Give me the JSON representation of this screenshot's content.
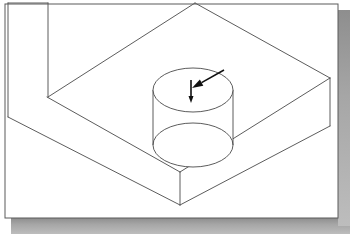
{
  "document": {
    "title": "Isometric Solid Model with Cylindrical Boss",
    "drawing_type": "isometric-line-drawing",
    "background_color": "#ffffff",
    "line_color": "#4a4a4a",
    "annotation_color": "#101010",
    "frame_color": "#5a5a5a",
    "shadow_color": "#9a9a9a"
  },
  "canvas": {
    "width": 350,
    "height": 234
  },
  "frame": {
    "name": "drawing-border",
    "x": 5,
    "y": 4,
    "width": 333,
    "height": 214,
    "shadow_offset": 6
  },
  "geometry": {
    "description": "Rectangular isometric base block with a notched upper-left step and a cylindrical boss rising from the top face.",
    "top_face": {
      "name": "block-top-face",
      "points": "8,3 48,3 48,97 195,3 330,78 180,172 47,97"
    },
    "left_face": {
      "name": "block-left-front-face",
      "points": "8,3 8,117 180,205 180,172 47,97 47,3"
    },
    "right_face": {
      "name": "block-right-front-face",
      "points": "180,172 330,78 330,126 180,205"
    },
    "edges": [
      {
        "name": "edge-top-back-left",
        "d": "M 8,3 L 48,3"
      },
      {
        "name": "edge-vertical-notch",
        "d": "M 48,3 L 48,97"
      },
      {
        "name": "edge-top-left-diagonal",
        "d": "M 48,97 L 195,3"
      },
      {
        "name": "edge-top-right-diagonal",
        "d": "M 195,3 L 330,78"
      },
      {
        "name": "edge-top-front-right",
        "d": "M 330,78 L 180,172"
      },
      {
        "name": "edge-top-front-left",
        "d": "M 180,172 L 47,97"
      },
      {
        "name": "edge-left-outer-vertical",
        "d": "M 8,3 L 8,117"
      },
      {
        "name": "edge-left-bottom-diagonal",
        "d": "M 8,117 L 180,205"
      },
      {
        "name": "edge-front-vertical",
        "d": "M 180,172 L 180,205"
      },
      {
        "name": "edge-right-vertical",
        "d": "M 330,78 L 330,126"
      },
      {
        "name": "edge-right-bottom-diagonal",
        "d": "M 330,126 L 180,205"
      }
    ]
  },
  "cylinder": {
    "name": "cylindrical-boss",
    "center_x": 193,
    "top_center_y": 90,
    "bottom_center_y": 145,
    "radius_x": 40,
    "radius_y": 22,
    "height": 55,
    "left_wall": {
      "name": "cylinder-left-silhouette",
      "d": "M 153,90 L 153,145"
    },
    "right_wall": {
      "name": "cylinder-right-silhouette",
      "d": "M 233,90 L 233,145"
    }
  },
  "annotations": {
    "diagonal_arrow": {
      "name": "diagonal-pointer-arrow",
      "label": "pointer to cylinder top face",
      "tail_x": 224,
      "tail_y": 70,
      "tip_x": 192,
      "tip_y": 88,
      "head_length": 11,
      "head_width": 7
    },
    "vertical_arrow": {
      "name": "vertical-depth-arrow",
      "label": "downward depth indicator",
      "tail_x": 191,
      "tail_y": 80,
      "tip_x": 191,
      "tip_y": 103,
      "head_length": 7,
      "head_width": 5
    }
  }
}
